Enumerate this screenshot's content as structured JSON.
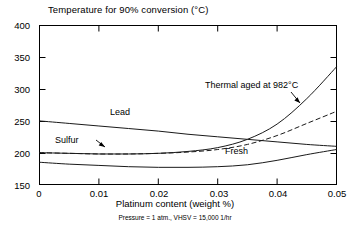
{
  "chart_data": {
    "type": "line",
    "title": "Temperature for 90% conversion (°C)",
    "xlabel": "Platinum content (weight %)",
    "ylabel": "Temperature for 90% conversion (°C)",
    "footnote": "Pressure = 1 atm., VHSV = 15,000 1/hr",
    "xlim": [
      0,
      0.05
    ],
    "ylim": [
      150,
      400
    ],
    "xticks": [
      "0",
      "0.01",
      "0.02",
      "0.03",
      "0.04",
      "0.05"
    ],
    "xtick_values": [
      0,
      0.01,
      0.02,
      0.03,
      0.04,
      0.05
    ],
    "yticks": [
      "150",
      "200",
      "250",
      "300",
      "350",
      "400"
    ],
    "ytick_values": [
      150,
      200,
      250,
      300,
      350,
      400
    ],
    "grid": false,
    "legend": "inline-labels",
    "series": [
      {
        "name": "Lead",
        "label": "Lead",
        "style": "solid",
        "x": [
          0,
          0.005,
          0.01,
          0.015,
          0.02,
          0.025,
          0.03,
          0.035,
          0.04,
          0.045,
          0.05
        ],
        "values": [
          250,
          246,
          242,
          238,
          234,
          229,
          225,
          221,
          217,
          213,
          210
        ]
      },
      {
        "name": "Sulfur",
        "label": "Sulfur",
        "style": "dashed",
        "x": [
          0,
          0.005,
          0.01,
          0.015,
          0.02,
          0.025,
          0.03,
          0.035,
          0.04,
          0.045,
          0.05
        ],
        "values": [
          200,
          199,
          198,
          198,
          199,
          201,
          205,
          213,
          227,
          246,
          265
        ]
      },
      {
        "name": "Fresh",
        "label": "Fresh",
        "style": "solid",
        "x": [
          0,
          0.005,
          0.01,
          0.015,
          0.02,
          0.025,
          0.03,
          0.035,
          0.04,
          0.045,
          0.05
        ],
        "values": [
          185,
          182,
          180,
          178,
          177,
          177,
          178,
          181,
          188,
          197,
          205
        ]
      },
      {
        "name": "Thermal aged at 982C",
        "label": "Thermal aged at 982°C",
        "style": "solid",
        "x": [
          0,
          0.005,
          0.01,
          0.015,
          0.02,
          0.025,
          0.03,
          0.035,
          0.04,
          0.045,
          0.05
        ],
        "values": [
          200,
          199,
          198,
          198,
          199,
          202,
          208,
          221,
          245,
          285,
          335
        ]
      }
    ],
    "annotations": [
      {
        "text": "Thermal aged at 982°C",
        "x": 0.034,
        "y": 292,
        "arrow_to_x": 0.0425,
        "arrow_to_y": 262
      },
      {
        "text": "Sulfur",
        "x": 0.0045,
        "y": 208,
        "arrow_to_x": 0.0105,
        "arrow_to_y": 199
      },
      {
        "text": "Lead",
        "x": 0.0145,
        "y": 256
      },
      {
        "text": "Fresh",
        "x": 0.0305,
        "y": 190
      }
    ]
  }
}
